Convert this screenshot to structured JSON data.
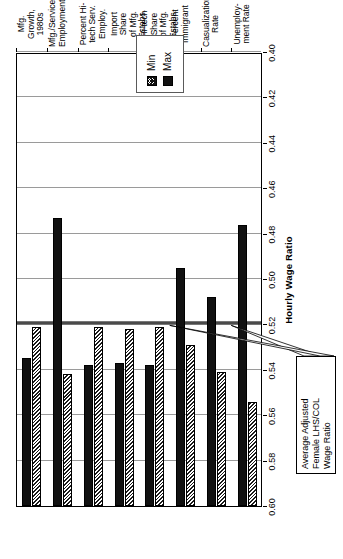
{
  "legend": {
    "position": "top-center",
    "items": [
      {
        "label": "Min",
        "icon": "hatched-swatch",
        "pattern": "hatch",
        "color": "#ffffff"
      },
      {
        "label": "Max",
        "icon": "solid-swatch",
        "pattern": "solid",
        "color": "#111111"
      }
    ]
  },
  "annotation": {
    "line1": "Average Adjusted",
    "line2": "Female LHS/COL",
    "line3": "Wage Ratio",
    "target_value": 0.52
  },
  "axis": {
    "title": "Hourly Wage Ratio",
    "ticks": [
      "0.60",
      "0.58",
      "0.56",
      "0.54",
      "0.52",
      "0.50",
      "0.48",
      "0.46",
      "0.44",
      "0.42",
      "0.40"
    ]
  },
  "categories_text": [
    {
      "l1": "Unemploy-",
      "l2": "ment Rate",
      "l3": ""
    },
    {
      "l1": "Casualization",
      "l2": "Rate",
      "l3": ""
    },
    {
      "l1": "Percent",
      "l2": "Immigrant",
      "l3": ""
    },
    {
      "l1": "Hi-tech Share",
      "l2": "of Mfg. Estabs.",
      "l3": ""
    },
    {
      "l1": "Import Share",
      "l2": "of Mfg. Estabs.",
      "l3": ""
    },
    {
      "l1": "Percent Hi-",
      "l2": "tech Serv.",
      "l3": "Employ."
    },
    {
      "l1": "Mfg./Service",
      "l2": "Employment",
      "l3": ""
    },
    {
      "l1": "Mfg. Growth,",
      "l2": "1980s",
      "l3": ""
    }
  ],
  "chart_data": {
    "type": "bar",
    "orientation": "horizontal",
    "title": "",
    "xlabel": "Hourly Wage Ratio",
    "ylabel": "",
    "xlim": [
      0.4,
      0.6
    ],
    "xticks": [
      0.6,
      0.58,
      0.56,
      0.54,
      0.52,
      0.5,
      0.48,
      0.46,
      0.44,
      0.42,
      0.4
    ],
    "grid": true,
    "legend_position": "top",
    "reference_line": {
      "value": 0.52,
      "label": "Average Adjusted Female LHS/COL Wage Ratio"
    },
    "categories": [
      "Unemployment Rate",
      "Casualization Rate",
      "Percent Immigrant",
      "Hi-tech Share of Mfg. Estabs.",
      "Import Share of Mfg. Estabs.",
      "Percent Hi-tech Serv. Employ.",
      "Mfg./Service Employment",
      "Mfg. Growth, 1980s"
    ],
    "series": [
      {
        "name": "Min",
        "values": [
          0.554,
          0.541,
          0.529,
          0.521,
          0.522,
          0.521,
          0.542,
          0.521
        ]
      },
      {
        "name": "Max",
        "values": [
          0.476,
          0.508,
          0.495,
          0.538,
          0.537,
          0.538,
          0.473,
          0.535
        ]
      }
    ]
  }
}
